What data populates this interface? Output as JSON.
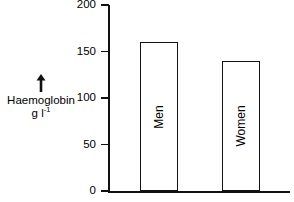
{
  "chart_data": {
    "type": "bar",
    "title": "",
    "xlabel": "",
    "ylabel": "Haemoglobin g l⁻¹",
    "ylabel_line1": "Haemoglobin",
    "ylabel_line2_base": "g l",
    "ylabel_line2_sup": "-1",
    "categories": [
      "Men",
      "Women"
    ],
    "values": [
      160,
      140
    ],
    "ylim": [
      0,
      200
    ],
    "yticks": [
      0,
      50,
      100,
      150,
      200
    ],
    "ytick_labels": [
      "0",
      "50",
      "100",
      "150",
      "200"
    ],
    "grid": false,
    "legend": "none",
    "units": "g l-1",
    "bar_fill_color": "#ffffff",
    "bar_edge_color": "#111111",
    "axis_color": "#111111",
    "background_color": "#ffffff",
    "axis_arrow": "up-arrow"
  },
  "bars": [
    {
      "label": "Men",
      "value": 160,
      "left_px": 140,
      "width_px": 38
    },
    {
      "label": "Women",
      "value": 140,
      "left_px": 222,
      "width_px": 38
    }
  ],
  "ticks": [
    {
      "label": "200",
      "value": 200,
      "top_px": 5
    },
    {
      "label": "150",
      "value": 150,
      "top_px": 51
    },
    {
      "label": "100",
      "value": 100,
      "top_px": 97
    },
    {
      "label": "50",
      "value": 50,
      "top_px": 144
    },
    {
      "label": "0",
      "value": 0,
      "top_px": 190
    }
  ]
}
